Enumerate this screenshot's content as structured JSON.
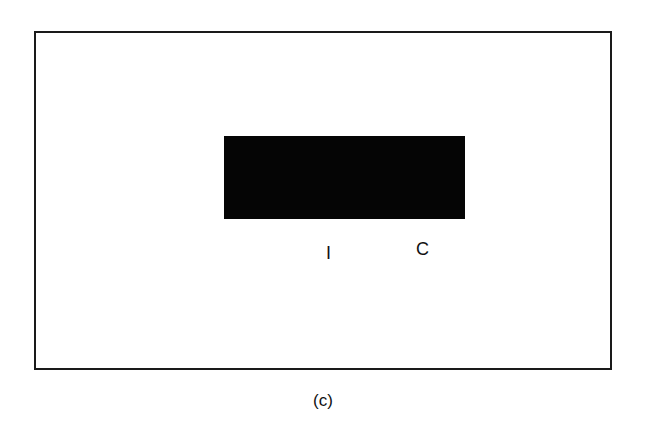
{
  "figure": {
    "caption": "(c)",
    "labels": {
      "left": "I",
      "right": "C"
    },
    "colors": {
      "frame_border": "#1a1a1a",
      "block_fill": "#050505",
      "background": "#ffffff"
    }
  }
}
